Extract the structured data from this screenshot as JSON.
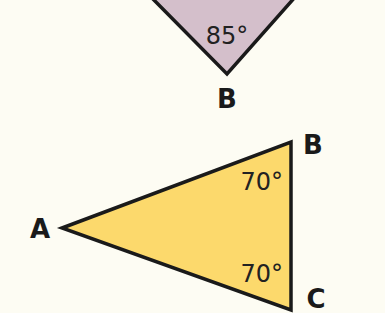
{
  "diagram": {
    "top_triangle": {
      "fill": "#d4bfcb",
      "stroke": "#1a1a1a",
      "angle_label": "85°",
      "vertex_label": "B"
    },
    "bottom_triangle": {
      "fill": "#fcd96c",
      "stroke": "#1a1a1a",
      "vertices": [
        {
          "label": "A"
        },
        {
          "label": "B"
        },
        {
          "label": "C"
        }
      ],
      "angle_labels": [
        "70°",
        "70°"
      ]
    }
  }
}
